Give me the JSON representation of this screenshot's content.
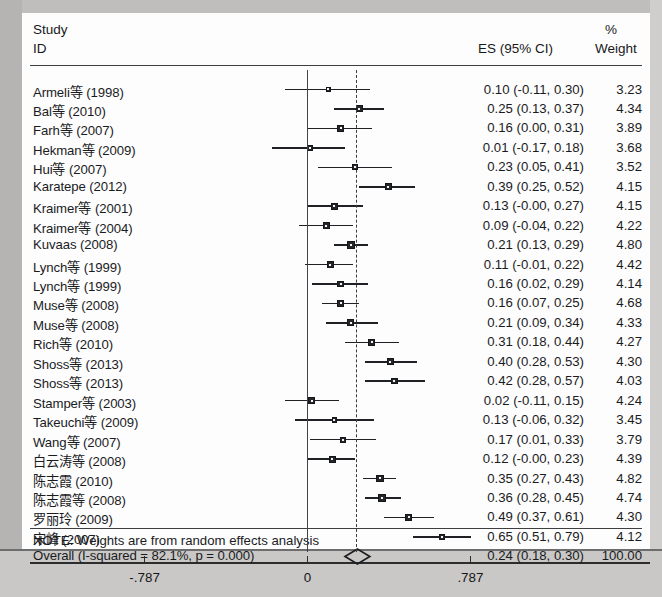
{
  "header": {
    "study": "Study",
    "id": "ID",
    "es": "ES (95% CI)",
    "percent": "%",
    "weight": "Weight"
  },
  "note": "NOTE: Weights are from random effects analysis",
  "overall": {
    "label": "Overall  (I-squared = 82.1%, p = 0.000)",
    "es_text": "0.24 (0.18, 0.30)",
    "weight_text": "100.00"
  },
  "axis": {
    "ticks": [
      "-.787",
      "0",
      ".787"
    ],
    "tick_values": [
      -0.787,
      0,
      0.787
    ]
  },
  "chart_data": {
    "type": "forest",
    "title": "",
    "xlabel": "",
    "ylabel": "",
    "xlim": [
      -0.92,
      0.92
    ],
    "axis_ticks": [
      -0.787,
      0,
      0.787
    ],
    "axis_tick_labels": [
      "-.787",
      "0",
      ".787"
    ],
    "null_line": 0,
    "summary_line": 0.24,
    "grid": false,
    "legend": "none",
    "effect_measure": "ES (95% CI)",
    "heterogeneity": "I-squared = 82.1%, p = 0.000",
    "overall": {
      "label": "Overall  (I-squared = 82.1%, p = 0.000)",
      "es": 0.24,
      "lo": 0.18,
      "hi": 0.3,
      "es_text": "0.24 (0.18, 0.30)",
      "weight": 100.0,
      "weight_text": "100.00"
    },
    "studies": [
      {
        "label": "Armeli等 (1998)",
        "es": 0.1,
        "lo": -0.11,
        "hi": 0.3,
        "es_text": "0.10 (-0.11, 0.30)",
        "weight": 3.23,
        "weight_text": "3.23"
      },
      {
        "label": "Bal等 (2010)",
        "es": 0.25,
        "lo": 0.13,
        "hi": 0.37,
        "es_text": "0.25 (0.13, 0.37)",
        "weight": 4.34,
        "weight_text": "4.34"
      },
      {
        "label": "Farh等 (2007)",
        "es": 0.16,
        "lo": 0.0,
        "hi": 0.31,
        "es_text": "0.16 (0.00, 0.31)",
        "weight": 3.89,
        "weight_text": "3.89"
      },
      {
        "label": "Hekman等 (2009)",
        "es": 0.01,
        "lo": -0.17,
        "hi": 0.18,
        "es_text": "0.01 (-0.17, 0.18)",
        "weight": 3.68,
        "weight_text": "3.68"
      },
      {
        "label": "Hui等 (2007)",
        "es": 0.23,
        "lo": 0.05,
        "hi": 0.41,
        "es_text": "0.23 (0.05, 0.41)",
        "weight": 3.52,
        "weight_text": "3.52"
      },
      {
        "label": "Karatepe (2012)",
        "es": 0.39,
        "lo": 0.25,
        "hi": 0.52,
        "es_text": "0.39 (0.25, 0.52)",
        "weight": 4.15,
        "weight_text": "4.15"
      },
      {
        "label": "Kraimer等 (2001)",
        "es": 0.13,
        "lo": -0.0,
        "hi": 0.27,
        "es_text": "0.13 (-0.00, 0.27)",
        "weight": 4.15,
        "weight_text": "4.15"
      },
      {
        "label": "Kraimer等 (2004)",
        "es": 0.09,
        "lo": -0.04,
        "hi": 0.22,
        "es_text": "0.09 (-0.04, 0.22)",
        "weight": 4.22,
        "weight_text": "4.22"
      },
      {
        "label": "Kuvaas (2008)",
        "es": 0.21,
        "lo": 0.13,
        "hi": 0.29,
        "es_text": "0.21 (0.13, 0.29)",
        "weight": 4.8,
        "weight_text": "4.80"
      },
      {
        "label": "Lynch等 (1999)",
        "es": 0.11,
        "lo": -0.01,
        "hi": 0.22,
        "es_text": "0.11 (-0.01, 0.22)",
        "weight": 4.42,
        "weight_text": "4.42"
      },
      {
        "label": "Lynch等 (1999)",
        "es": 0.16,
        "lo": 0.02,
        "hi": 0.29,
        "es_text": "0.16 (0.02, 0.29)",
        "weight": 4.14,
        "weight_text": "4.14"
      },
      {
        "label": "Muse等 (2008)",
        "es": 0.16,
        "lo": 0.07,
        "hi": 0.25,
        "es_text": "0.16 (0.07, 0.25)",
        "weight": 4.68,
        "weight_text": "4.68"
      },
      {
        "label": "Muse等 (2008)",
        "es": 0.21,
        "lo": 0.09,
        "hi": 0.34,
        "es_text": "0.21 (0.09, 0.34)",
        "weight": 4.33,
        "weight_text": "4.33"
      },
      {
        "label": "Rich等 (2010)",
        "es": 0.31,
        "lo": 0.18,
        "hi": 0.44,
        "es_text": "0.31 (0.18, 0.44)",
        "weight": 4.27,
        "weight_text": "4.27"
      },
      {
        "label": "Shoss等 (2013)",
        "es": 0.4,
        "lo": 0.28,
        "hi": 0.53,
        "es_text": "0.40 (0.28, 0.53)",
        "weight": 4.3,
        "weight_text": "4.30"
      },
      {
        "label": "Shoss等 (2013)",
        "es": 0.42,
        "lo": 0.28,
        "hi": 0.57,
        "es_text": "0.42 (0.28, 0.57)",
        "weight": 4.03,
        "weight_text": "4.03"
      },
      {
        "label": "Stamper等 (2003)",
        "es": 0.02,
        "lo": -0.11,
        "hi": 0.15,
        "es_text": "0.02 (-0.11, 0.15)",
        "weight": 4.24,
        "weight_text": "4.24"
      },
      {
        "label": "Takeuchi等 (2009)",
        "es": 0.13,
        "lo": -0.06,
        "hi": 0.32,
        "es_text": "0.13 (-0.06, 0.32)",
        "weight": 3.45,
        "weight_text": "3.45"
      },
      {
        "label": "Wang等 (2007)",
        "es": 0.17,
        "lo": 0.01,
        "hi": 0.33,
        "es_text": "0.17 (0.01, 0.33)",
        "weight": 3.79,
        "weight_text": "3.79"
      },
      {
        "label": "白云涛等 (2008)",
        "es": 0.12,
        "lo": -0.0,
        "hi": 0.23,
        "es_text": "0.12 (-0.00, 0.23)",
        "weight": 4.39,
        "weight_text": "4.39"
      },
      {
        "label": "陈志霞 (2010)",
        "es": 0.35,
        "lo": 0.27,
        "hi": 0.43,
        "es_text": "0.35 (0.27, 0.43)",
        "weight": 4.82,
        "weight_text": "4.82"
      },
      {
        "label": "陈志霞等 (2008)",
        "es": 0.36,
        "lo": 0.28,
        "hi": 0.45,
        "es_text": "0.36 (0.28, 0.45)",
        "weight": 4.74,
        "weight_text": "4.74"
      },
      {
        "label": "罗丽玲 (2009)",
        "es": 0.49,
        "lo": 0.37,
        "hi": 0.61,
        "es_text": "0.49 (0.37, 0.61)",
        "weight": 4.3,
        "weight_text": "4.30"
      },
      {
        "label": "宋峰 (2007)",
        "es": 0.65,
        "lo": 0.51,
        "hi": 0.79,
        "es_text": "0.65 (0.51, 0.79)",
        "weight": 4.12,
        "weight_text": "4.12"
      }
    ]
  }
}
